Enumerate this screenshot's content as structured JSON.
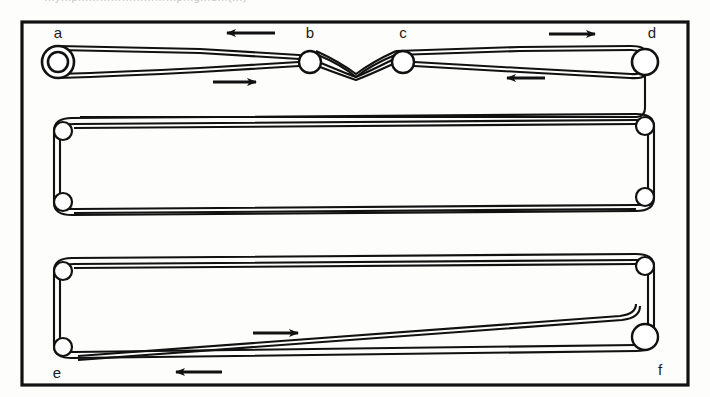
{
  "figure": {
    "caption_partial": "…y…p………………………p…g…d…(…)",
    "background_color": "#fdfdfc",
    "ink_color": "#111111",
    "frame": {
      "x": 22,
      "y": 22,
      "width": 666,
      "height": 363,
      "stroke_width": 3
    }
  },
  "labels": {
    "a": "a",
    "b": "b",
    "c": "c",
    "d": "d",
    "e": "e",
    "f": "f"
  },
  "pulleys": [
    {
      "id": "a",
      "label": "a",
      "cx": 58,
      "cy": 62,
      "r": 16,
      "style": "double-ring",
      "label_x": 58,
      "label_y": 38
    },
    {
      "id": "b",
      "label": "b",
      "cx": 310,
      "cy": 62,
      "r": 11,
      "style": "ring",
      "label_x": 310,
      "label_y": 38
    },
    {
      "id": "c",
      "label": "c",
      "cx": 403,
      "cy": 62,
      "r": 11,
      "style": "ring",
      "label_x": 403,
      "label_y": 38
    },
    {
      "id": "d",
      "label": "d",
      "cx": 645,
      "cy": 62,
      "r": 13,
      "style": "ring",
      "label_x": 652,
      "label_y": 38
    },
    {
      "id": "m1",
      "label": "",
      "cx": 63,
      "cy": 131,
      "r": 9,
      "style": "ring"
    },
    {
      "id": "m2",
      "label": "",
      "cx": 63,
      "cy": 202,
      "r": 9,
      "style": "ring"
    },
    {
      "id": "m3",
      "label": "",
      "cx": 645,
      "cy": 126,
      "r": 9,
      "style": "ring"
    },
    {
      "id": "m4",
      "label": "",
      "cx": 645,
      "cy": 197,
      "r": 9,
      "style": "ring"
    },
    {
      "id": "e",
      "label": "e",
      "cx": 63,
      "cy": 347,
      "r": 9,
      "style": "ring",
      "label_x": 57,
      "label_y": 378
    },
    {
      "id": "b1",
      "label": "",
      "cx": 63,
      "cy": 271,
      "r": 9,
      "style": "ring"
    },
    {
      "id": "b2",
      "label": "",
      "cx": 645,
      "cy": 266,
      "r": 9,
      "style": "ring"
    },
    {
      "id": "f",
      "label": "f",
      "cx": 645,
      "cy": 337,
      "r": 13,
      "style": "ring",
      "label_x": 660,
      "label_y": 375
    }
  ],
  "arrows": [
    {
      "id": "arrow-top-left",
      "direction": "left",
      "x1": 275,
      "y1": 33,
      "x2": 225,
      "y2": 33
    },
    {
      "id": "arrow-top-right",
      "direction": "right",
      "x1": 549,
      "y1": 34,
      "x2": 597,
      "y2": 34
    },
    {
      "id": "arrow-upper-mid",
      "direction": "right",
      "x1": 213,
      "y1": 82,
      "x2": 258,
      "y2": 82
    },
    {
      "id": "arrow-upper-right",
      "direction": "left",
      "x1": 545,
      "y1": 78,
      "x2": 505,
      "y2": 78
    },
    {
      "id": "arrow-bottom-mid",
      "direction": "right",
      "x1": 253,
      "y1": 333,
      "x2": 300,
      "y2": 333
    },
    {
      "id": "arrow-bottom-left",
      "direction": "left",
      "x1": 222,
      "y1": 372,
      "x2": 174,
      "y2": 372
    }
  ],
  "belts": [
    {
      "id": "belt-top",
      "description": "crossed belt between pulleys a, b, c and d"
    },
    {
      "id": "belt-middle",
      "description": "tapered loop over four idler pulleys"
    },
    {
      "id": "belt-bottom",
      "description": "tapered loop between pulleys e and f"
    }
  ],
  "diagram_type": "line-drawing"
}
